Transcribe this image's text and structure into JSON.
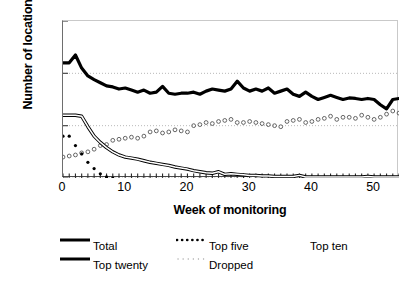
{
  "chart_data": {
    "type": "line",
    "title": "",
    "xlabel": "Week of monitoring",
    "ylabel": "Number of locations",
    "xlim": [
      0,
      54
    ],
    "ylim": [
      0,
      3
    ],
    "xticks": [
      0,
      10,
      20,
      30,
      40,
      50
    ],
    "yticks": [
      0,
      1,
      2,
      3
    ],
    "grid": "horizontal dotted gridlines at y = 1 and y = 2",
    "legend_position": "below plot, two columns plus trailing label",
    "x": [
      0,
      1,
      2,
      3,
      4,
      5,
      6,
      7,
      8,
      9,
      10,
      11,
      12,
      13,
      14,
      15,
      16,
      17,
      18,
      19,
      20,
      21,
      22,
      23,
      24,
      25,
      26,
      27,
      28,
      29,
      30,
      31,
      32,
      33,
      34,
      35,
      36,
      37,
      38,
      39,
      40,
      41,
      42,
      43,
      44,
      45,
      46,
      47,
      48,
      49,
      50,
      51,
      52,
      53,
      54
    ],
    "series": [
      {
        "name": "Total",
        "style": "thick solid black line",
        "color": "#000000",
        "values": [
          2.2,
          2.2,
          2.35,
          2.1,
          1.95,
          1.88,
          1.82,
          1.76,
          1.74,
          1.7,
          1.72,
          1.68,
          1.64,
          1.68,
          1.62,
          1.64,
          1.75,
          1.62,
          1.6,
          1.62,
          1.62,
          1.64,
          1.6,
          1.66,
          1.7,
          1.68,
          1.66,
          1.7,
          1.85,
          1.72,
          1.66,
          1.7,
          1.66,
          1.72,
          1.62,
          1.66,
          1.7,
          1.6,
          1.56,
          1.64,
          1.56,
          1.5,
          1.54,
          1.58,
          1.54,
          1.5,
          1.53,
          1.52,
          1.5,
          1.52,
          1.5,
          1.4,
          1.32,
          1.5,
          1.52
        ]
      },
      {
        "name": "Top twenty",
        "style": "solid line with light fill (double line)",
        "color": "#000000",
        "values": [
          1.2,
          1.2,
          1.2,
          1.18,
          0.98,
          0.8,
          0.68,
          0.58,
          0.5,
          0.44,
          0.4,
          0.38,
          0.36,
          0.33,
          0.3,
          0.28,
          0.26,
          0.24,
          0.21,
          0.19,
          0.17,
          0.14,
          0.12,
          0.1,
          0.09,
          0.12,
          0.07,
          0.08,
          0.07,
          0.06,
          0.05,
          0.05,
          0.04,
          0.04,
          0.03,
          0.03,
          0.03,
          0.03,
          0.05,
          0.02,
          0.02,
          0.02,
          0.02,
          0.02,
          0.02,
          0.02,
          0.02,
          0.02,
          0.02,
          0.03,
          0.02,
          0.02,
          0.02,
          0.02,
          0.02
        ]
      },
      {
        "name": "Top five",
        "style": "bold dotted",
        "color": "#000000",
        "values": [
          0.8,
          0.8,
          0.62,
          0.46,
          0.3,
          0.18,
          0.08,
          0.02,
          0.0,
          0.0,
          0.0,
          0.0,
          0.0,
          0.0,
          0.0,
          0.0,
          0.0,
          0.0,
          0.0,
          0.0,
          0.0,
          0.0,
          0.0,
          0.0,
          0.0,
          0.0,
          0.0,
          0.0,
          0.0,
          0.0,
          0.0,
          0.0,
          0.0,
          0.0,
          0.0,
          0.0,
          0.0,
          0.0,
          0.0,
          0.0,
          0.0,
          0.0,
          0.0,
          0.0,
          0.0,
          0.0,
          0.0,
          0.0,
          0.0,
          0.0,
          0.0,
          0.0,
          0.0,
          0.0,
          0.0
        ]
      },
      {
        "name": "Top ten",
        "style": "open circle markers, no connecting line",
        "color": "#555555",
        "values": [
          0.4,
          0.42,
          0.44,
          0.48,
          0.5,
          0.55,
          0.62,
          0.64,
          0.72,
          0.74,
          0.76,
          0.78,
          0.76,
          0.8,
          0.88,
          0.9,
          0.86,
          0.88,
          0.92,
          0.9,
          0.88,
          1.0,
          1.02,
          1.06,
          1.04,
          1.08,
          1.1,
          1.12,
          1.06,
          1.06,
          1.08,
          1.06,
          1.04,
          1.02,
          1.0,
          0.98,
          1.08,
          1.1,
          1.12,
          1.06,
          1.08,
          1.12,
          1.14,
          1.18,
          1.12,
          1.16,
          1.16,
          1.14,
          1.2,
          1.16,
          1.12,
          1.16,
          1.22,
          1.28,
          1.24
        ]
      },
      {
        "name": "Dropped",
        "style": "fine dotted, lies along zero",
        "color": "#9a9a9a",
        "values": [
          0.0,
          0.0,
          0.0,
          0.0,
          0.0,
          0.0,
          0.0,
          0.0,
          0.0,
          0.0,
          0.0,
          0.0,
          0.0,
          0.0,
          0.0,
          0.0,
          0.0,
          0.0,
          0.0,
          0.0,
          0.0,
          0.0,
          0.0,
          0.0,
          0.0,
          0.0,
          0.0,
          0.0,
          0.0,
          0.0,
          0.0,
          0.0,
          0.0,
          0.0,
          0.0,
          0.0,
          0.0,
          0.0,
          0.0,
          0.0,
          0.0,
          0.0,
          0.0,
          0.0,
          0.0,
          0.0,
          0.0,
          0.0,
          0.0,
          0.0,
          0.0,
          0.0,
          0.0,
          0.0,
          0.0
        ]
      }
    ]
  },
  "axes": {
    "ylabel": "Number of locations",
    "xlabel": "Week of monitoring",
    "yticks": [
      "0",
      "1",
      "2",
      "3"
    ],
    "xticks": [
      "0",
      "10",
      "20",
      "30",
      "40",
      "50"
    ]
  },
  "legend": {
    "items": [
      {
        "label": "Total",
        "key": "thick-line"
      },
      {
        "label": "Top five",
        "key": "bold-dotted"
      },
      {
        "label": "Top ten",
        "key": "none"
      },
      {
        "label": "Top twenty",
        "key": "thick-line"
      },
      {
        "label": "Dropped",
        "key": "fine-dotted"
      }
    ]
  },
  "colors": {
    "series_primary": "#000000",
    "series_marker": "#555555",
    "series_faint": "#9a9a9a",
    "gridline": "#b9b9b9",
    "axis": "#4a4a4a",
    "background": "#ffffff"
  }
}
